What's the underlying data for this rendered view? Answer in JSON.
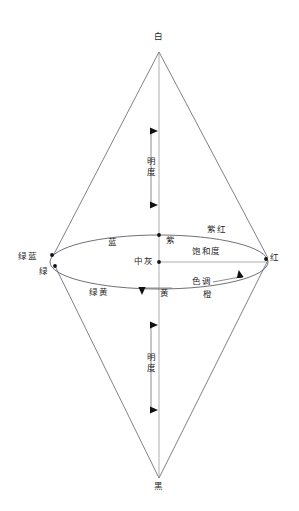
{
  "diagram": {
    "type": "double-cone-color-model",
    "stroke_color": "#3a3a4a",
    "axis_color": "#9a9a9a",
    "text_color": "#1f1f1f",
    "background": "#ffffff",
    "apex": {
      "top_label": "白",
      "bottom_label": "黑"
    },
    "axes": [
      {
        "name": "brightness-top",
        "label": "明度"
      },
      {
        "name": "brightness-bottom",
        "label": "明度"
      },
      {
        "name": "saturation",
        "label": "饱和度"
      },
      {
        "name": "hue",
        "label": "色调"
      }
    ],
    "center_label": "中灰",
    "hue_labels": [
      {
        "name": "red",
        "text": "红"
      },
      {
        "name": "magenta",
        "text": "紫红"
      },
      {
        "name": "purple",
        "text": "紫"
      },
      {
        "name": "blue",
        "text": "蓝"
      },
      {
        "name": "green-blue",
        "text": "绿蓝"
      },
      {
        "name": "green",
        "text": "绿"
      },
      {
        "name": "green-yellow",
        "text": "绿黄"
      },
      {
        "name": "yellow",
        "text": "黄"
      },
      {
        "name": "orange",
        "text": "橙"
      }
    ]
  }
}
